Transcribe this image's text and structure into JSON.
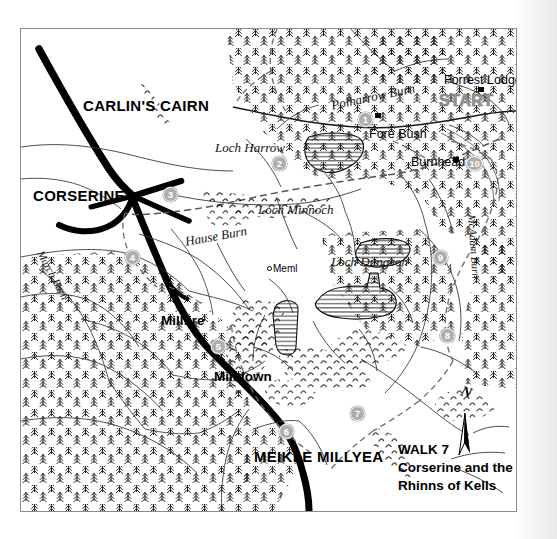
{
  "map": {
    "title_block": {
      "line1": "WALK 7",
      "line2": "Corserine and the",
      "line3": "Rhinns of Kells"
    },
    "north_arrow_letter": "N",
    "start_label": "START",
    "peaks": [
      {
        "id": "carlins-cairn",
        "label": "CARLIN'S CAIRN",
        "x": 82,
        "y": 97,
        "cls": "peak"
      },
      {
        "id": "corserine",
        "label": "CORSERINE",
        "x": 32,
        "y": 187,
        "cls": "peak"
      },
      {
        "id": "meikle-millyea",
        "label": "MEIKLE MILLYEA",
        "x": 253,
        "y": 448,
        "cls": "peak"
      },
      {
        "id": "millfire",
        "label": "Millfire",
        "x": 160,
        "y": 313,
        "cls": "peak-sm"
      },
      {
        "id": "milldown",
        "label": "Milldown",
        "x": 213,
        "y": 369,
        "cls": "peak-sm"
      }
    ],
    "water_labels": [
      {
        "id": "loch-harrow",
        "label": "Loch Harrow",
        "x": 214,
        "y": 140
      },
      {
        "id": "loch-minnoch",
        "label": "Loch Minnoch",
        "x": 257,
        "y": 202
      },
      {
        "id": "loch-dungeon",
        "label": "Loch Dungeon",
        "x": 330,
        "y": 254
      },
      {
        "id": "polharrow-burn",
        "label": "Polharrow Burn",
        "x": 329,
        "y": 98,
        "rotate": -12
      },
      {
        "id": "hause-burn",
        "label": "Hause Burn",
        "x": 183,
        "y": 234,
        "rotate": -10
      },
      {
        "id": "march-burn",
        "label": "March Burn",
        "x": 44,
        "y": 248,
        "rotate": 62
      },
      {
        "id": "mcadam-burn",
        "label": "McAdam Burn",
        "x": 476,
        "y": 213,
        "rotate": 86
      }
    ],
    "places": [
      {
        "id": "forrest-lodge",
        "label": "Forrest Lodge",
        "x": 443,
        "y": 73
      },
      {
        "id": "fore-bush",
        "label": "Fore Bush",
        "x": 368,
        "y": 127
      },
      {
        "id": "burnhead",
        "label": "Burnhead",
        "x": 410,
        "y": 155
      },
      {
        "id": "meml",
        "label": "Meml",
        "x": 272,
        "y": 263
      }
    ],
    "route_markers": [
      {
        "number": "1",
        "x": 364,
        "y": 111
      },
      {
        "number": "2",
        "x": 278,
        "y": 155
      },
      {
        "number": "3",
        "x": 169,
        "y": 186
      },
      {
        "number": "4",
        "x": 131,
        "y": 249
      },
      {
        "number": "5",
        "x": 217,
        "y": 338
      },
      {
        "number": "6",
        "x": 285,
        "y": 423
      },
      {
        "number": "7",
        "x": 356,
        "y": 405
      },
      {
        "number": "8",
        "x": 446,
        "y": 327
      },
      {
        "number": "9",
        "x": 439,
        "y": 249
      },
      {
        "number": "10",
        "x": 473,
        "y": 155
      }
    ],
    "buildings": [
      {
        "id": "forrest-lodge-building",
        "x": 477,
        "y": 86
      },
      {
        "id": "fore-bush-building",
        "x": 374,
        "y": 112
      },
      {
        "id": "burnhead-building",
        "x": 452,
        "y": 156
      }
    ],
    "colors": {
      "marker_fill": "#adadad",
      "ridge_black": "#000000",
      "paper": "#ffffff",
      "frame_border": "#8d8d8d",
      "start_grey": "#9a9a9a"
    }
  }
}
